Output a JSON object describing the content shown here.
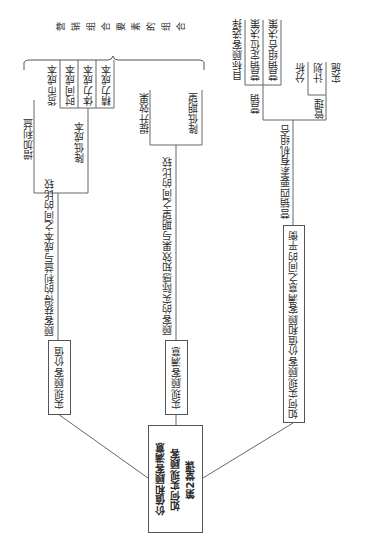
{
  "center": {
    "line1": "第2堂课",
    "line2": "如何实现顾客",
    "line3": "价值和顾客满意"
  },
  "branches": [
    {
      "label": "实现顾客价值",
      "relation": "顾客获得的利益与成本之间的比较",
      "children": [
        {
          "label": "增加利益"
        },
        {
          "label": "降低成本",
          "children": [
            "货币成本",
            "时间成本",
            "体力成本",
            "精力成本"
          ]
        }
      ]
    },
    {
      "label": "实现顾客满意",
      "relation": "顾客的实际感知效果与期望之间的比较",
      "children": [
        {
          "label": "提升效果"
        },
        {
          "label": "降低期望"
        }
      ]
    },
    {
      "label": "如何实现顾客价值和顾客满意之间的平衡",
      "relation": "营销四要素有机组合",
      "children": [
        {
          "label": "营销",
          "children": [
            "目标顾客选择",
            "营销定位决策",
            "营销组合决策"
          ]
        },
        {
          "label": "管理",
          "children": [
            "分析",
            "计划",
            "实施"
          ]
        }
      ]
    }
  ],
  "bracket_label": "营销组合要素的组合"
}
